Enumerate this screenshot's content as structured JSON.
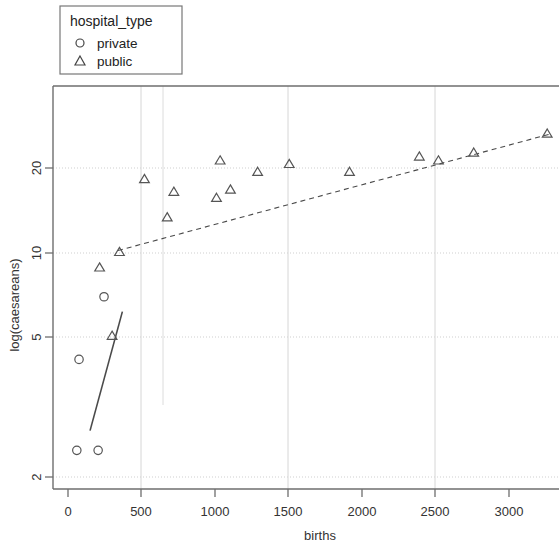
{
  "legend": {
    "title": "hospital_type",
    "items": [
      {
        "label": "private",
        "glyph": "circle-marker"
      },
      {
        "label": "public",
        "glyph": "triangle-marker"
      }
    ]
  },
  "axes": {
    "x_label": "births",
    "y_label": "log(caesareans)",
    "x_ticks": [
      "0",
      "500",
      "1000",
      "1500",
      "2000",
      "2500",
      "3000"
    ],
    "y_ticks": [
      "2",
      "5",
      "10",
      "20"
    ]
  },
  "chart_data": {
    "type": "scatter",
    "title": "",
    "xlabel": "births",
    "ylabel": "log(caesareans)",
    "xlim": [
      -110,
      3420
    ],
    "ylim": [
      1.75,
      28
    ],
    "yscale": "log",
    "xscale": "linear",
    "grid": true,
    "legend_position": "top-left-outside",
    "legend_title": "hospital_type",
    "series": [
      {
        "name": "private",
        "marker": "circle",
        "color": "#555555",
        "points": [
          {
            "x": 60,
            "y": 2.0
          },
          {
            "x": 205,
            "y": 2.0
          },
          {
            "x": 75,
            "y": 4.2
          },
          {
            "x": 245,
            "y": 7.0
          }
        ],
        "fit_line": {
          "style": "solid",
          "x_start": 150,
          "y_start": 2.35,
          "x_end": 370,
          "y_end": 6.2
        }
      },
      {
        "name": "public",
        "marker": "triangle",
        "color": "#555555",
        "points": [
          {
            "x": 215,
            "y": 8.9
          },
          {
            "x": 300,
            "y": 5.1
          },
          {
            "x": 350,
            "y": 10.1
          },
          {
            "x": 520,
            "y": 18.3
          },
          {
            "x": 675,
            "y": 13.4
          },
          {
            "x": 720,
            "y": 16.5
          },
          {
            "x": 1010,
            "y": 15.7
          },
          {
            "x": 1035,
            "y": 21.3
          },
          {
            "x": 1105,
            "y": 16.8
          },
          {
            "x": 1290,
            "y": 19.4
          },
          {
            "x": 1505,
            "y": 20.7
          },
          {
            "x": 1915,
            "y": 19.4
          },
          {
            "x": 2390,
            "y": 22.0
          },
          {
            "x": 2520,
            "y": 21.3
          },
          {
            "x": 2760,
            "y": 22.7
          },
          {
            "x": 3260,
            "y": 26.5
          }
        ],
        "fit_line": {
          "style": "dashed",
          "x_start": 340,
          "y_start": 10.2,
          "x_end": 3270,
          "y_end": 26.3
        }
      }
    ],
    "gridlines": {
      "vertical_x": [
        500,
        1500,
        2500
      ],
      "vertical_partial_x": [
        680
      ],
      "horizontal_y": [
        2,
        5,
        10,
        20
      ]
    }
  }
}
